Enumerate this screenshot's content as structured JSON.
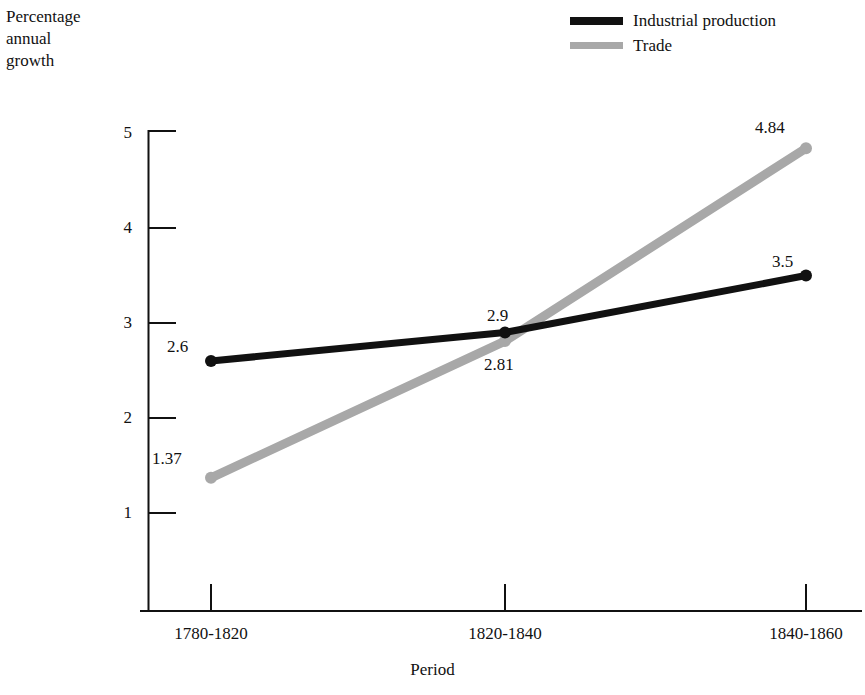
{
  "chart_data": {
    "type": "line",
    "title": "",
    "xlabel": "Period",
    "ylabel": "Percentage\nannual\ngrowth",
    "categories": [
      "1780-1820",
      "1820-1840",
      "1840-1860"
    ],
    "yticks": [
      1,
      2,
      3,
      4,
      5
    ],
    "ylim": [
      0,
      5
    ],
    "grid": false,
    "legend_position": "top-right",
    "series": [
      {
        "name": "Industrial production",
        "color": "#111111",
        "values": [
          2.6,
          2.9,
          3.5
        ],
        "point_labels": [
          "2.6",
          "2.9",
          "3.5"
        ]
      },
      {
        "name": "Trade",
        "color": "#a8a8a8",
        "values": [
          1.37,
          2.81,
          4.84
        ],
        "point_labels": [
          "1.37",
          "2.81",
          "4.84"
        ]
      }
    ]
  },
  "legend": {
    "items": [
      {
        "label": "Industrial production",
        "color": "#111111"
      },
      {
        "label": "Trade",
        "color": "#a8a8a8"
      }
    ]
  },
  "axes": {
    "y_title": "Percentage\nannual\ngrowth",
    "x_title": "Period",
    "y_tick_labels": [
      "5",
      "4",
      "3",
      "2",
      "1"
    ],
    "x_tick_labels": [
      "1780-1820",
      "1820-1840",
      "1840-1860"
    ]
  },
  "value_labels": {
    "industrial": [
      "2.6",
      "2.9",
      "3.5"
    ],
    "trade": [
      "1.37",
      "2.81",
      "4.84"
    ]
  }
}
